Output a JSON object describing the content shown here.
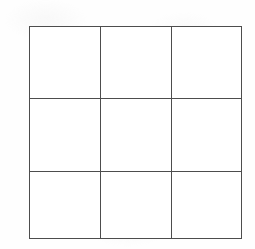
{
  "figure": {
    "type": "grid",
    "name": "3x3-empty-grid",
    "description": "Empty 3 by 3 grid of squares drawn with thin dark lines on white paper",
    "rows": 3,
    "columns": 3,
    "cell_count": 9,
    "cells": [
      {
        "id": "r1c1",
        "row": 1,
        "column": 1,
        "content": ""
      },
      {
        "id": "r1c2",
        "row": 1,
        "column": 2,
        "content": ""
      },
      {
        "id": "r1c3",
        "row": 1,
        "column": 3,
        "content": ""
      },
      {
        "id": "r2c1",
        "row": 2,
        "column": 1,
        "content": ""
      },
      {
        "id": "r2c2",
        "row": 2,
        "column": 2,
        "content": ""
      },
      {
        "id": "r2c3",
        "row": 2,
        "column": 3,
        "content": ""
      },
      {
        "id": "r3c1",
        "row": 3,
        "column": 1,
        "content": ""
      },
      {
        "id": "r3c2",
        "row": 3,
        "column": 2,
        "content": ""
      },
      {
        "id": "r3c3",
        "row": 3,
        "column": 3,
        "content": ""
      }
    ]
  },
  "geometry": {
    "canvas_width": 255,
    "canvas_height": 249,
    "grid_left": 29,
    "grid_top": 26,
    "grid_width": 213,
    "grid_height": 213,
    "vertical_divider_x": [
      71,
      142
    ],
    "horizontal_divider_y": [
      72,
      145
    ],
    "line_thickness": 1.3
  },
  "colors": {
    "background": "#fefefe",
    "line": "#4d4d4d",
    "cell_fill": "#ffffff"
  }
}
